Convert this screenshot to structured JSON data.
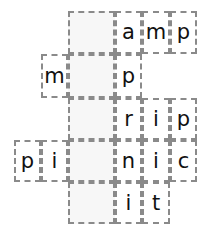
{
  "puzzle": {
    "title": "crossword-letter-grid",
    "columns": 6,
    "rows": 5,
    "colors": {
      "grid_line": "#8a8a8a",
      "letter": "#111111",
      "cell_fill": "#ffffff",
      "blank_fill": "#f7f7f7",
      "page_background": "#ffffff"
    },
    "col_x": [
      14,
      41,
      68,
      115,
      142,
      170,
      197
    ],
    "row_y": [
      11,
      54,
      98,
      140,
      182,
      224
    ],
    "cells": [
      {
        "id": "cell-r0c2",
        "row": 0,
        "col": 2,
        "letter": "",
        "state": "blank"
      },
      {
        "id": "cell-r0c3",
        "row": 0,
        "col": 3,
        "letter": "a",
        "state": "filled"
      },
      {
        "id": "cell-r0c4",
        "row": 0,
        "col": 4,
        "letter": "m",
        "state": "filled"
      },
      {
        "id": "cell-r0c5",
        "row": 0,
        "col": 5,
        "letter": "p",
        "state": "filled"
      },
      {
        "id": "cell-r1c1",
        "row": 1,
        "col": 1,
        "letter": "m",
        "state": "filled"
      },
      {
        "id": "cell-r1c2",
        "row": 1,
        "col": 2,
        "letter": "",
        "state": "blank"
      },
      {
        "id": "cell-r1c3",
        "row": 1,
        "col": 3,
        "letter": "p",
        "state": "filled"
      },
      {
        "id": "cell-r2c2",
        "row": 2,
        "col": 2,
        "letter": "",
        "state": "blank"
      },
      {
        "id": "cell-r2c3",
        "row": 2,
        "col": 3,
        "letter": "r",
        "state": "filled"
      },
      {
        "id": "cell-r2c4",
        "row": 2,
        "col": 4,
        "letter": "i",
        "state": "filled"
      },
      {
        "id": "cell-r2c5",
        "row": 2,
        "col": 5,
        "letter": "p",
        "state": "filled"
      },
      {
        "id": "cell-r3c0",
        "row": 3,
        "col": 0,
        "letter": "p",
        "state": "filled"
      },
      {
        "id": "cell-r3c1",
        "row": 3,
        "col": 1,
        "letter": "i",
        "state": "filled"
      },
      {
        "id": "cell-r3c2",
        "row": 3,
        "col": 2,
        "letter": "",
        "state": "blank"
      },
      {
        "id": "cell-r3c3",
        "row": 3,
        "col": 3,
        "letter": "n",
        "state": "filled"
      },
      {
        "id": "cell-r3c4",
        "row": 3,
        "col": 4,
        "letter": "i",
        "state": "filled"
      },
      {
        "id": "cell-r3c5",
        "row": 3,
        "col": 5,
        "letter": "c",
        "state": "filled"
      },
      {
        "id": "cell-r4c2",
        "row": 4,
        "col": 2,
        "letter": "",
        "state": "blank"
      },
      {
        "id": "cell-r4c3",
        "row": 4,
        "col": 3,
        "letter": "i",
        "state": "filled"
      },
      {
        "id": "cell-r4c4",
        "row": 4,
        "col": 4,
        "letter": "t",
        "state": "filled"
      }
    ]
  }
}
